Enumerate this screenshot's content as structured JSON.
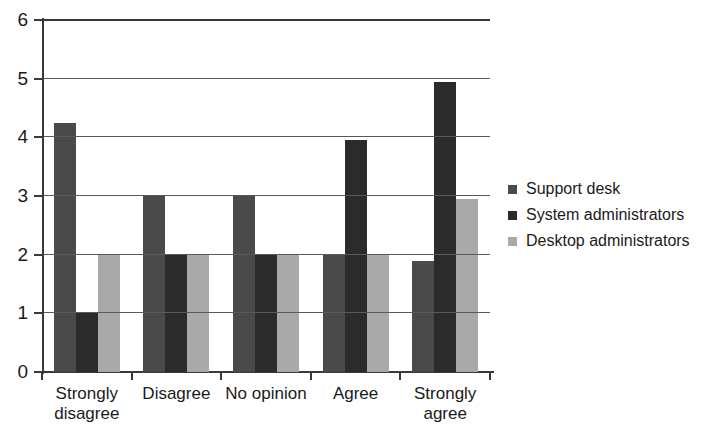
{
  "chart_data": {
    "type": "bar",
    "title": "",
    "subtitle": "",
    "xlabel": "",
    "ylabel": "",
    "ylim": [
      0,
      6
    ],
    "yticks": [
      0,
      1,
      2,
      3,
      4,
      5,
      6
    ],
    "ytick_labels": [
      "0",
      "1",
      "2",
      "3",
      "4",
      "5",
      "6"
    ],
    "grid": true,
    "grid_axis": "y",
    "legend_position": "right",
    "orientation": "vertical",
    "grouping": "grouped",
    "categories": [
      "Strongly\ndisagree",
      "Disagree",
      "No opinion",
      "Agree",
      "Strongly\nagree"
    ],
    "series": [
      {
        "name": "Support desk",
        "color": "#4a4a4a",
        "values": [
          4.25,
          3,
          3,
          2,
          1.9
        ]
      },
      {
        "name": "System administrators",
        "color": "#2b2b2b",
        "values": [
          1,
          2,
          2,
          3.95,
          4.95
        ]
      },
      {
        "name": "Desktop administrators",
        "color": "#a9a9a9",
        "values": [
          2,
          2,
          2,
          2,
          2.95
        ]
      }
    ]
  },
  "legend": {
    "items": [
      {
        "label": "Support desk",
        "color": "#4a4a4a"
      },
      {
        "label": "System administrators",
        "color": "#2b2b2b"
      },
      {
        "label": "Desktop administrators",
        "color": "#a9a9a9"
      }
    ]
  },
  "axes": {
    "y": {
      "min": 0,
      "max": 6,
      "ticks": [
        "0",
        "1",
        "2",
        "3",
        "4",
        "5",
        "6"
      ]
    },
    "x": {
      "ticks": [
        "Strongly\ndisagree",
        "Disagree",
        "No opinion",
        "Agree",
        "Strongly\nagree"
      ]
    }
  },
  "colors": {
    "series_1": "#4a4a4a",
    "series_2": "#2b2b2b",
    "series_3": "#a9a9a9",
    "axis": "#3a3a3a",
    "grid": "#5a5a5a",
    "background": "#ffffff",
    "text": "#1a1a1a"
  }
}
